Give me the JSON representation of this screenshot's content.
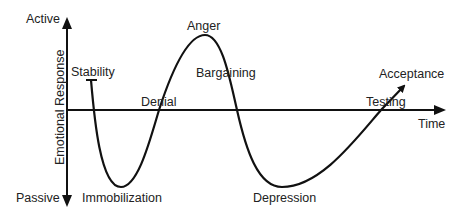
{
  "diagram": {
    "axes": {
      "y_label": "Emotional Response",
      "y_top": "Active",
      "y_bottom": "Passive",
      "x_label": "Time"
    },
    "stages": [
      {
        "name": "Stability",
        "position": "start, slightly above baseline"
      },
      {
        "name": "Immobilization",
        "position": "first trough"
      },
      {
        "name": "Denial",
        "position": "crossing baseline upward"
      },
      {
        "name": "Anger",
        "position": "peak"
      },
      {
        "name": "Bargaining",
        "position": "descending from peak"
      },
      {
        "name": "Depression",
        "position": "deepest trough"
      },
      {
        "name": "Testing",
        "position": "crossing baseline upward"
      },
      {
        "name": "Acceptance",
        "position": "end, arrow upward"
      }
    ],
    "colors": {
      "line": "#111111",
      "text": "#222222",
      "background": "#ffffff"
    }
  }
}
